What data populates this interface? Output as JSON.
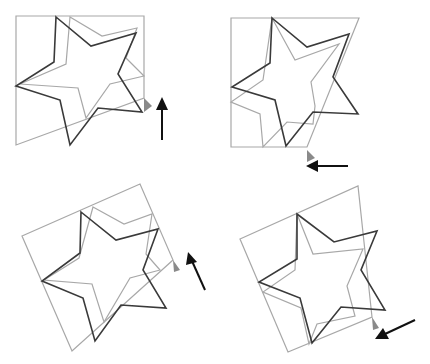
{
  "diagram": {
    "colors": {
      "frame": "#a8a8a8",
      "star_gray": "#a8a8a8",
      "star_dark": "#3a3a3a",
      "marker": "#8a8a8a",
      "arrow": "#111111"
    },
    "panels": [
      {
        "id": "panel-top-left",
        "position": "top-left",
        "arrow_direction": "up",
        "frame": "16,16 144,16 144,98 16,145",
        "star_dark": "56,17 91,46 136,33 118,74 142,112 98,108 70,145 60,100 16,86 54,62",
        "star_gray": "70,17 102,36 137,28 126,58 144,76 110,84 86,118 78,88 20,84 66,64",
        "marker": "144,98 152,106 144,112",
        "arrow": {
          "x1": 162,
          "y1": 140,
          "x2": 162,
          "y2": 100
        }
      },
      {
        "id": "panel-top-right",
        "position": "top-right",
        "arrow_direction": "left",
        "frame": "16,18 144,18 92,147 16,147",
        "star_dark": "57,18 92,47 134,34 118,77 143,114 98,112 71,146 60,100 17,87 55,63",
        "star_gray": "57,18 80,60 124,44 96,82 100,106 98,124 72,122 48,147 45,114 16,102 48,80",
        "marker": "92,150 100,158 92,162",
        "arrow": {
          "x1": 133,
          "y1": 166,
          "x2": 92,
          "y2": 166
        }
      },
      {
        "id": "panel-bottom-left",
        "position": "bottom-left",
        "arrow_direction": "up-left",
        "frame": "22,54 140,2 173,78 72,169",
        "star_dark": "81,30 116,58 158,47 143,88 166,126 121,123 95,159 83,116 42,99 80,71",
        "star_gray": "93,25 124,42 152,32 146,72 160,88 130,96 104,140 92,102 44,98 79,76",
        "marker": "173,78 180,88 174,90",
        "arrow": {
          "x1": 205,
          "y1": 108,
          "x2": 190,
          "y2": 72
        }
      },
      {
        "id": "panel-bottom-right",
        "position": "bottom-right",
        "arrow_direction": "down-left",
        "frame": "25,57 143,4 157,135 73,170",
        "star_dark": "82,32 119,60 162,49 146,88 170,128 126,125 97,161 85,116 44,100 82,77",
        "star_gray": "82,32 98,72 148,67 132,104 140,134 102,142 94,162 86,126 48,110 80,88",
        "marker": "157,135 164,146 158,148",
        "arrow": {
          "x1": 200,
          "y1": 138,
          "x2": 162,
          "y2": 156
        }
      }
    ]
  }
}
